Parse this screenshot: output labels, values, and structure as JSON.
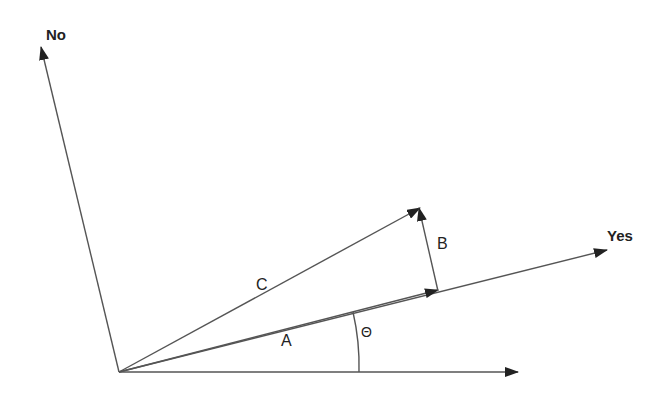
{
  "diagram": {
    "type": "vector-projection",
    "axes": {
      "no_label": "No",
      "yes_label": "Yes"
    },
    "vectors": {
      "a_label": "A",
      "b_label": "B",
      "c_label": "C"
    },
    "angle_label": "Θ",
    "colors": {
      "line": "#555555",
      "arrowhead": "#222222",
      "text": "#222222",
      "background": "#ffffff"
    }
  }
}
